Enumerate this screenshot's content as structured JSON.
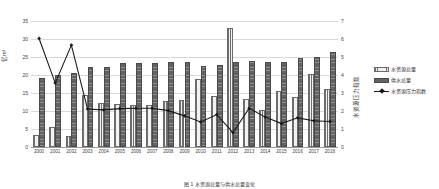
{
  "chart_data": {
    "type": "bar",
    "title": "",
    "categories": [
      "2000",
      "2001",
      "2002",
      "2003",
      "2004",
      "2005",
      "2006",
      "2007",
      "2008",
      "2009",
      "2010",
      "2011",
      "2012",
      "2013",
      "2014",
      "2015",
      "2016",
      "2017",
      "2018"
    ],
    "series": [
      {
        "name": "水资源总量",
        "axis": "left",
        "values": [
          3.2,
          5.5,
          3.0,
          14.4,
          12.1,
          12.0,
          11.8,
          11.6,
          12.9,
          13.1,
          18.8,
          14.2,
          33.1,
          13.2,
          10.4,
          15.6,
          13.9,
          20.4,
          16.1
        ]
      },
      {
        "name": "供水总量",
        "axis": "left",
        "values": [
          19.3,
          19.9,
          20.5,
          22.2,
          22.2,
          23.3,
          23.3,
          23.3,
          23.5,
          23.7,
          22.6,
          22.9,
          23.7,
          23.9,
          23.6,
          23.7,
          24.6,
          25.1,
          26.3
        ]
      },
      {
        "name": "水资源压力指数",
        "axis": "right",
        "values": [
          6.03,
          3.55,
          5.66,
          2.11,
          2.06,
          2.13,
          2.15,
          2.15,
          2.02,
          1.73,
          1.39,
          1.8,
          0.8,
          2.15,
          1.66,
          1.3,
          1.62,
          1.46,
          1.42
        ]
      }
    ],
    "xlabel": "",
    "ylabel_left": "亿m³",
    "ylabel_right": "水资源压力指数",
    "ylim_left": [
      0,
      35
    ],
    "ylim_right": [
      0,
      7
    ],
    "yticks_left": [
      "0",
      "5",
      "10",
      "15",
      "20",
      "25",
      "30",
      "35"
    ],
    "yticks_right": [
      "0",
      "1",
      "2",
      "3",
      "4",
      "5",
      "6",
      "7"
    ],
    "grid": true,
    "legend_position": "right"
  },
  "legend": {
    "items": [
      {
        "label": "水资源总量",
        "marker": "hatched-bar-swatch"
      },
      {
        "label": "供水总量",
        "marker": "solid-bar-swatch"
      },
      {
        "label": "水资源压力指数",
        "marker": "line-marker-swatch"
      }
    ]
  },
  "caption": {
    "text": "图 1  水资源总量与供水总量变化"
  },
  "colors": {
    "resource_bar": "#f2f2f2",
    "supply_bar": "#626262",
    "index_line": "#1a1a1a",
    "gridline": "#d9d9d9",
    "axis_text": "#404040"
  }
}
